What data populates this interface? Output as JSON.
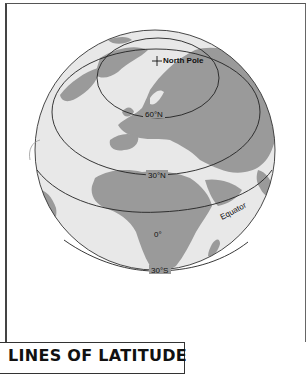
{
  "figure": {
    "title": "LINES OF LATITUDE",
    "colors": {
      "land": "#9a9a9a",
      "ocean": "#e8e8e8",
      "lines": "#222222",
      "frame": "#444444"
    },
    "markers": [
      {
        "name": "north-pole",
        "symbol": "+",
        "label": "North Pole"
      }
    ],
    "latitude_lines": [
      {
        "label": "60°N"
      },
      {
        "label": "30°N"
      },
      {
        "label": "Equator",
        "value_label": "0°"
      },
      {
        "label": "30°S"
      }
    ]
  }
}
